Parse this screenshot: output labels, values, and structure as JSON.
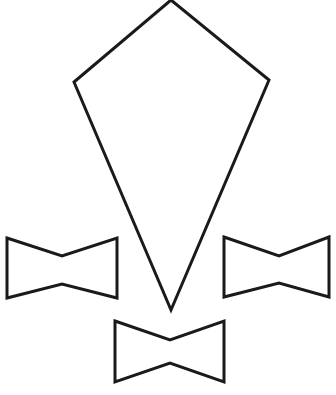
{
  "canvas": {
    "width": 336,
    "height": 395,
    "background_color": "#ffffff",
    "stroke_color": "#1a1a1a",
    "stroke_width": 3,
    "fill": "none",
    "description": "Black line-art outline drawing on plain white background"
  },
  "figure": {
    "name": "kite-and-bowties",
    "shape_count": 4
  },
  "shapes": [
    {
      "id": "kite",
      "name": "kite-shape",
      "type": "polygon",
      "sides": 4,
      "label": "Kite",
      "closed": true,
      "fill": "none",
      "stroke": "#1a1a1a",
      "points": "171,0 74,82 171,310 269,80",
      "vertices": [
        {
          "name": "top-apex",
          "x": 171,
          "y": 0
        },
        {
          "name": "left-shoulder",
          "x": 74,
          "y": 82
        },
        {
          "name": "bottom-tip",
          "x": 171,
          "y": 310
        },
        {
          "name": "right-shoulder",
          "x": 269,
          "y": 80
        }
      ],
      "bounds": {
        "x": 74,
        "y": 0,
        "width": 195,
        "height": 310
      }
    },
    {
      "id": "bowtie-left",
      "name": "left-bowtie-shape",
      "type": "polygon",
      "sides": 6,
      "label": "Left bowtie",
      "closed": true,
      "fill": "none",
      "stroke": "#1a1a1a",
      "points": "7,238 62,256 117,238 117,298 62,284 7,298",
      "vertices": [
        {
          "name": "top-left",
          "x": 7,
          "y": 238
        },
        {
          "name": "top-notch",
          "x": 62,
          "y": 256
        },
        {
          "name": "top-right",
          "x": 117,
          "y": 238
        },
        {
          "name": "bottom-right",
          "x": 117,
          "y": 298
        },
        {
          "name": "bottom-notch",
          "x": 62,
          "y": 284
        },
        {
          "name": "bottom-left",
          "x": 7,
          "y": 298
        }
      ],
      "bounds": {
        "x": 7,
        "y": 238,
        "width": 110,
        "height": 60
      }
    },
    {
      "id": "bowtie-right",
      "name": "right-bowtie-shape",
      "type": "polygon",
      "sides": 6,
      "label": "Right bowtie",
      "closed": true,
      "fill": "none",
      "stroke": "#1a1a1a",
      "points": "224,237 279,256 329,237 329,297 279,283 224,297",
      "vertices": [
        {
          "name": "top-left",
          "x": 224,
          "y": 237
        },
        {
          "name": "top-notch",
          "x": 279,
          "y": 256
        },
        {
          "name": "top-right",
          "x": 329,
          "y": 237
        },
        {
          "name": "bottom-right",
          "x": 329,
          "y": 297
        },
        {
          "name": "bottom-notch",
          "x": 279,
          "y": 283
        },
        {
          "name": "bottom-left",
          "x": 224,
          "y": 297
        }
      ],
      "bounds": {
        "x": 224,
        "y": 237,
        "width": 105,
        "height": 60
      }
    },
    {
      "id": "bowtie-bottom",
      "name": "bottom-bowtie-shape",
      "type": "polygon",
      "sides": 6,
      "label": "Bottom bowtie",
      "closed": true,
      "fill": "none",
      "stroke": "#1a1a1a",
      "points": "115,321 170,340 224,321 224,382 170,363 115,382",
      "vertices": [
        {
          "name": "top-left",
          "x": 115,
          "y": 321
        },
        {
          "name": "top-notch",
          "x": 170,
          "y": 340
        },
        {
          "name": "top-right",
          "x": 224,
          "y": 321
        },
        {
          "name": "bottom-right",
          "x": 224,
          "y": 382
        },
        {
          "name": "bottom-notch",
          "x": 170,
          "y": 363
        },
        {
          "name": "bottom-left",
          "x": 115,
          "y": 382
        }
      ],
      "bounds": {
        "x": 115,
        "y": 321,
        "width": 109,
        "height": 61
      }
    }
  ]
}
